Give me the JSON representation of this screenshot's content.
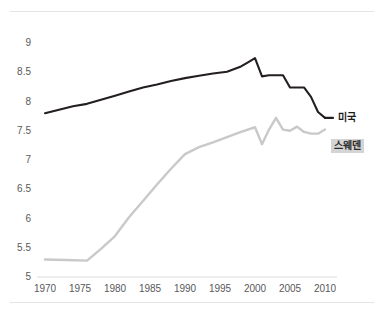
{
  "chart_data": {
    "type": "line",
    "title": "",
    "subtitle": "",
    "xlabel": "",
    "ylabel": "",
    "xlim": [
      1970,
      2010
    ],
    "ylim": [
      5,
      9
    ],
    "grid": false,
    "legend_position": "right-inline",
    "x_tick_labels": [
      "1970",
      "1975",
      "1980",
      "1985",
      "1990",
      "1995",
      "2000",
      "2005",
      "2010"
    ],
    "x_ticks": [
      1970,
      1975,
      1980,
      1985,
      1990,
      1995,
      2000,
      2005,
      2010
    ],
    "y_tick_labels": [
      "9",
      "8.5",
      "8",
      "7.5",
      "7",
      "6.5",
      "6",
      "5.5",
      "5"
    ],
    "y_ticks": [
      9,
      8.5,
      8,
      7.5,
      7,
      6.5,
      6,
      5.5,
      5
    ],
    "series": [
      {
        "name": "미국",
        "color": "#231f20",
        "label_style": "plain",
        "x": [
          1970,
          1972,
          1974,
          1976,
          1978,
          1980,
          1982,
          1984,
          1986,
          1988,
          1990,
          1992,
          1994,
          1996,
          1998,
          1999,
          2000,
          2001,
          2002,
          2003,
          2004,
          2005,
          2006,
          2007,
          2008,
          2009,
          2010
        ],
        "values": [
          7.8,
          7.86,
          7.92,
          7.96,
          8.03,
          8.1,
          8.17,
          8.24,
          8.29,
          8.35,
          8.4,
          8.44,
          8.48,
          8.51,
          8.6,
          8.67,
          8.74,
          8.43,
          8.45,
          8.45,
          8.45,
          8.24,
          8.24,
          8.24,
          8.08,
          7.82,
          7.72
        ]
      },
      {
        "name": "스웨덴",
        "color": "#c9c9c9",
        "label_style": "highlight",
        "x": [
          1970,
          1973,
          1976,
          1978,
          1980,
          1982,
          1984,
          1986,
          1988,
          1990,
          1992,
          1994,
          1996,
          1998,
          2000,
          2001,
          2002,
          2003,
          2004,
          2005,
          2006,
          2007,
          2008,
          2009,
          2010
        ],
        "values": [
          5.3,
          5.29,
          5.28,
          5.48,
          5.7,
          6.02,
          6.3,
          6.58,
          6.85,
          7.1,
          7.22,
          7.3,
          7.39,
          7.48,
          7.56,
          7.27,
          7.52,
          7.72,
          7.52,
          7.5,
          7.57,
          7.48,
          7.45,
          7.45,
          7.52
        ]
      }
    ]
  },
  "legend": {
    "usa": "미국",
    "sweden": "스웨덴"
  },
  "colors": {
    "usa_line": "#231f20",
    "sweden_line": "#c9c9c9",
    "sweden_badge_bg": "#d4d4d4",
    "tick_text": "#58595b",
    "rule": "#e3e3e3",
    "background": "#ffffff"
  }
}
